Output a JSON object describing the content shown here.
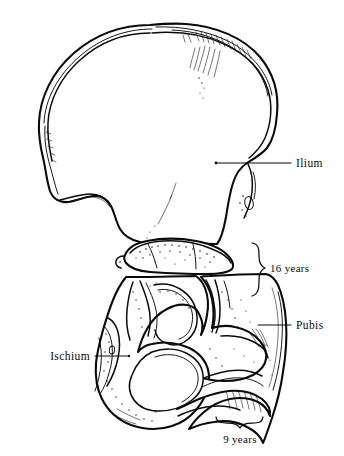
{
  "figure": {
    "background_color": "#ffffff",
    "ink_color": "#0b0b0b",
    "width": 344,
    "height": 456
  },
  "labels": {
    "ilium": "Ilium",
    "pubis": "Pubis",
    "ischium": "Ischium",
    "age_upper": "16 years",
    "age_lower": "9 years"
  },
  "annotations": [
    {
      "id": "ilium",
      "text": "Ilium",
      "type": "leader-line",
      "text_x": 296,
      "text_y": 167,
      "leader_from_x": 216,
      "leader_from_y": 163,
      "leader_to_x": 291,
      "leader_to_y": 163,
      "anchor": "start"
    },
    {
      "id": "16-years",
      "text": "16 years",
      "type": "brace",
      "text_x": 271,
      "text_y": 272,
      "brace_x": 261,
      "brace_top_y": 243,
      "brace_bottom_y": 297,
      "anchor": "start"
    },
    {
      "id": "pubis",
      "text": "Pubis",
      "type": "leader-line",
      "text_x": 296,
      "text_y": 329,
      "leader_from_x": 258,
      "leader_from_y": 325,
      "leader_to_x": 291,
      "leader_to_y": 325,
      "anchor": "start"
    },
    {
      "id": "ischium",
      "text": "Ischium",
      "type": "leader-line",
      "text_x": 88,
      "text_y": 360,
      "leader_from_x": 93,
      "leader_from_y": 356,
      "leader_to_x": 128,
      "leader_to_y": 356,
      "anchor": "end"
    },
    {
      "id": "9-years",
      "text": "9 years",
      "type": "brace",
      "text_x": 245,
      "text_y": 442,
      "brace_y": 423,
      "brace_left_x": 216,
      "brace_right_x": 262,
      "anchor": "middle"
    }
  ],
  "bone_parts": [
    {
      "id": "ilium",
      "name": "Ilium",
      "region": "upper blade"
    },
    {
      "id": "ischium",
      "name": "Ischium",
      "region": "lower left"
    },
    {
      "id": "pubis",
      "name": "Pubis",
      "region": "lower right"
    },
    {
      "id": "triradiate",
      "name": "Triradiate cartilage",
      "region": "acetabulum center"
    }
  ]
}
